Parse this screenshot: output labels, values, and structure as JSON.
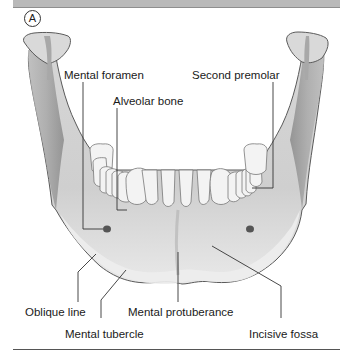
{
  "figure": {
    "panel_letter": "A",
    "labels": {
      "mental_foramen": "Mental foramen",
      "alveolar_bone": "Alveolar bone",
      "second_premolar": "Second premolar",
      "oblique_line": "Oblique line",
      "mental_protuberance": "Mental protuberance",
      "mental_tubercle": "Mental tubercle",
      "incisive_fossa": "Incisive fossa"
    },
    "colors": {
      "bone_light": "#e6e6e6",
      "bone_mid": "#c4c4c4",
      "bone_dark": "#8f8f8f",
      "tooth": "#f2f2f2",
      "outline": "#555555",
      "leader": "#333333",
      "header_bar": "#b9b9b9"
    }
  }
}
